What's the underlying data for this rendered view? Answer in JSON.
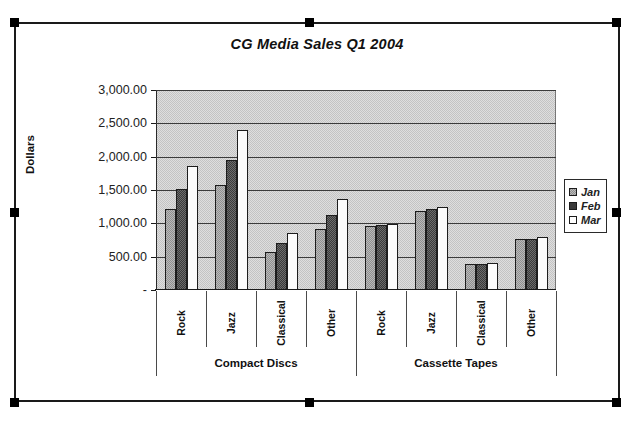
{
  "chart_data": {
    "type": "bar",
    "title": "CG Media Sales Q1 2004",
    "xlabel": "",
    "ylabel": "Dollars",
    "ylim": [
      0,
      3000
    ],
    "ytick_labels": [
      "3,000.00",
      "2,500.00",
      "2,000.00",
      "1,500.00",
      "1,000.00",
      "500.00",
      "-"
    ],
    "ytick_values": [
      3000,
      2500,
      2000,
      1500,
      1000,
      500,
      0
    ],
    "grid": true,
    "legend_position": "right",
    "legend": [
      "Jan",
      "Feb",
      "Mar"
    ],
    "groups": [
      {
        "label": "Compact Discs",
        "categories": [
          "Rock",
          "Jazz",
          "Classical",
          "Other"
        ]
      },
      {
        "label": "Cassette Tapes",
        "categories": [
          "Rock",
          "Jazz",
          "Classical",
          "Other"
        ]
      }
    ],
    "categories": [
      "Compact Discs - Rock",
      "Compact Discs - Jazz",
      "Compact Discs - Classical",
      "Compact Discs - Other",
      "Cassette Tapes - Rock",
      "Cassette Tapes - Jazz",
      "Cassette Tapes - Classical",
      "Cassette Tapes - Other"
    ],
    "series": [
      {
        "name": "Jan",
        "color": "#8f8f8f",
        "values": [
          1220,
          1580,
          570,
          910,
          960,
          1190,
          390,
          760
        ]
      },
      {
        "name": "Feb",
        "color": "#3a3a3a",
        "values": [
          1520,
          1950,
          700,
          1120,
          975,
          1220,
          385,
          770
        ]
      },
      {
        "name": "Mar",
        "color": "#ffffff",
        "values": [
          1860,
          2400,
          860,
          1370,
          990,
          1240,
          400,
          790
        ]
      }
    ]
  },
  "chart": {
    "title": "CG Media Sales Q1 2004",
    "y_axis_title": "Dollars",
    "plot_background": "#c3c3c3",
    "border_color": "#1a1a1a"
  },
  "legend": {
    "items": [
      {
        "label": "Jan",
        "swatch_class": "jan"
      },
      {
        "label": "Feb",
        "swatch_class": "feb"
      },
      {
        "label": "Mar",
        "swatch_class": "mar"
      }
    ]
  }
}
